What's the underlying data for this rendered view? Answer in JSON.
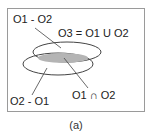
{
  "diagram": {
    "labels": {
      "o1_minus_o2": "O1 - O2",
      "o3_union": "O3 = O1 U O2",
      "o2_minus_o1": "O2 - O1",
      "intersection": "O1 ∩ O2"
    },
    "caption": "(a)",
    "colors": {
      "border": "#9a9a9a",
      "ellipse_stroke": "#444444",
      "intersection_fill": "#b4b4b4",
      "text": "#222222"
    }
  }
}
